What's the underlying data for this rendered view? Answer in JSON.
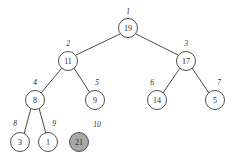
{
  "diagram": {
    "type": "binary-heap-tree",
    "background_color": "#ffffff",
    "edge_color": "#4a4a4a",
    "node_stroke_color": "#4f4f4f",
    "node_fill_color": "#ffffff",
    "highlight_fill_color": "#a8a8a8",
    "text_color": "#2b2b2b",
    "node_radius": 9.5,
    "nodes": [
      {
        "id": "n1",
        "index": "1",
        "key": "19",
        "cx": 128,
        "cy": 28,
        "r": 9.5,
        "shaded": false,
        "index_x": 128,
        "index_y": 11
      },
      {
        "id": "n2",
        "index": "2",
        "key": "11",
        "cx": 68,
        "cy": 61,
        "r": 9.5,
        "shaded": false,
        "index_x": 68,
        "index_y": 43
      },
      {
        "id": "n3",
        "index": "3",
        "key": "17",
        "cx": 186,
        "cy": 61,
        "r": 9.5,
        "shaded": false,
        "index_x": 186,
        "index_y": 43
      },
      {
        "id": "n4",
        "index": "4",
        "key": "8",
        "cx": 35,
        "cy": 100,
        "r": 9.5,
        "shaded": false,
        "index_x": 35,
        "index_y": 82
      },
      {
        "id": "n5",
        "index": "5",
        "key": "9",
        "cx": 95,
        "cy": 100,
        "r": 9.5,
        "shaded": false,
        "index_x": 97,
        "index_y": 82
      },
      {
        "id": "n6",
        "index": "6",
        "key": "14",
        "cx": 157,
        "cy": 100,
        "r": 9.5,
        "shaded": false,
        "index_x": 152,
        "index_y": 82
      },
      {
        "id": "n7",
        "index": "7",
        "key": "5",
        "cx": 215,
        "cy": 100,
        "r": 9.5,
        "shaded": false,
        "index_x": 219,
        "index_y": 82
      },
      {
        "id": "n8",
        "index": "8",
        "key": "3",
        "cx": 20,
        "cy": 142,
        "r": 9.5,
        "shaded": false,
        "index_x": 15,
        "index_y": 123
      },
      {
        "id": "n9",
        "index": "9",
        "key": "1",
        "cx": 48,
        "cy": 142,
        "r": 9.5,
        "shaded": false,
        "index_x": 54,
        "index_y": 123
      },
      {
        "id": "n10",
        "index": "10",
        "key": "21",
        "cx": 79,
        "cy": 142,
        "r": 9.5,
        "shaded": true,
        "index_x": 97,
        "index_y": 124
      }
    ],
    "edges": [
      {
        "id": "e1",
        "from": "n1",
        "to": "n2",
        "x1": 120,
        "y1": 34,
        "x2": 76,
        "y2": 55
      },
      {
        "id": "e2",
        "from": "n1",
        "to": "n3",
        "x1": 136,
        "y1": 34,
        "x2": 178,
        "y2": 55
      },
      {
        "id": "e3",
        "from": "n2",
        "to": "n4",
        "x1": 62,
        "y1": 68,
        "x2": 41,
        "y2": 93
      },
      {
        "id": "e4",
        "from": "n2",
        "to": "n5",
        "x1": 74,
        "y1": 68,
        "x2": 90,
        "y2": 93
      },
      {
        "id": "e5",
        "from": "n3",
        "to": "n6",
        "x1": 180,
        "y1": 68,
        "x2": 163,
        "y2": 93
      },
      {
        "id": "e6",
        "from": "n3",
        "to": "n7",
        "x1": 192,
        "y1": 68,
        "x2": 209,
        "y2": 93
      },
      {
        "id": "e7",
        "from": "n4",
        "to": "n8",
        "x1": 31,
        "y1": 108,
        "x2": 24,
        "y2": 134
      },
      {
        "id": "e8",
        "from": "n4",
        "to": "n9",
        "x1": 39,
        "y1": 108,
        "x2": 46,
        "y2": 134
      }
    ]
  }
}
